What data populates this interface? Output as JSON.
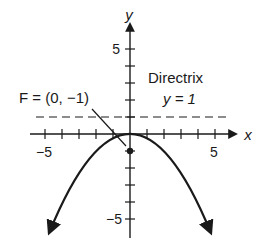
{
  "diagram": {
    "type": "parabola-graph",
    "equation": "y = -x^2/4",
    "axes": {
      "x_label": "x",
      "y_label": "y",
      "x_tick_labels": [
        {
          "value": -5,
          "text": "−5"
        },
        {
          "value": 5,
          "text": "5"
        }
      ],
      "y_tick_labels": [
        {
          "value": 5,
          "text": "5"
        },
        {
          "value": -5,
          "text": "−5"
        }
      ],
      "x_range": [
        -5,
        5
      ],
      "y_range": [
        -5,
        5
      ]
    },
    "focus": {
      "label": "F = (0, −1)",
      "x": 0,
      "y": -1
    },
    "directrix": {
      "title": "Directrix",
      "equation": "y = 1",
      "y": 1,
      "style": "dashed"
    },
    "colors": {
      "stroke": "#1a1a1a",
      "background": "#ffffff"
    }
  }
}
